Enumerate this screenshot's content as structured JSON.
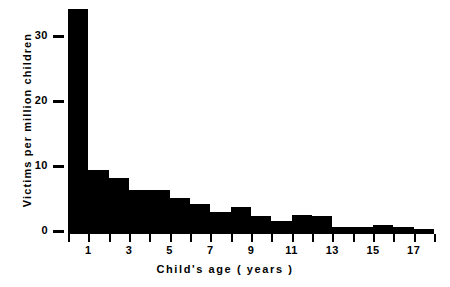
{
  "chart_data": {
    "type": "bar",
    "title": "",
    "xlabel": "Child's age  ( years )",
    "ylabel": "Victims per million children",
    "categories": [
      "0",
      "1",
      "2",
      "3",
      "4",
      "5",
      "6",
      "7",
      "8",
      "9",
      "10",
      "11",
      "12",
      "13",
      "14",
      "15",
      "16",
      "17"
    ],
    "values": [
      34.2,
      9.5,
      8.3,
      6.5,
      6.5,
      5.2,
      4.3,
      3.1,
      3.8,
      2.4,
      1.7,
      2.6,
      2.4,
      0.8,
      0.8,
      1.1,
      0.8,
      0.4
    ],
    "bar_width_years": 1,
    "xlim": [
      0,
      18
    ],
    "ylim": [
      0,
      35
    ],
    "xticks": [
      0,
      1,
      2,
      3,
      4,
      5,
      6,
      7,
      8,
      9,
      10,
      11,
      12,
      13,
      14,
      15,
      16,
      17,
      18
    ],
    "xtick_labels": [
      "1",
      "3",
      "5",
      "7",
      "9",
      "11",
      "13",
      "15",
      "17"
    ],
    "xtick_label_values": [
      1,
      3,
      5,
      7,
      9,
      11,
      13,
      15,
      17
    ],
    "yticks": [
      0,
      10,
      20,
      30
    ],
    "ytick_labels": [
      "0",
      "10",
      "20",
      "30"
    ],
    "grid": false,
    "legend": null,
    "bar_color": "#000000",
    "background_color": "#ffffff"
  }
}
